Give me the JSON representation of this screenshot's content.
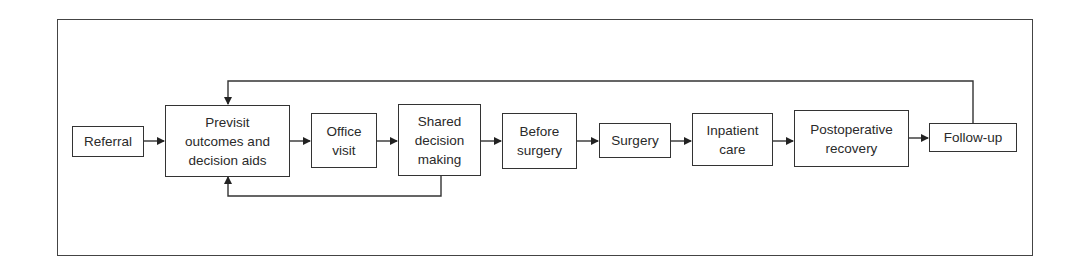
{
  "diagram": {
    "type": "flowchart",
    "direction": "left-to-right",
    "nodes": [
      {
        "id": "referral",
        "label": "Referral"
      },
      {
        "id": "previsit",
        "label": "Previsit\noutcomes and\ndecision aids"
      },
      {
        "id": "office",
        "label": "Office\nvisit"
      },
      {
        "id": "shared",
        "label": "Shared\ndecision\nmaking"
      },
      {
        "id": "before",
        "label": "Before\nsurgery"
      },
      {
        "id": "surgery",
        "label": "Surgery"
      },
      {
        "id": "inpatient",
        "label": "Inpatient\ncare"
      },
      {
        "id": "postop",
        "label": "Postoperative\nrecovery"
      },
      {
        "id": "followup",
        "label": "Follow-up"
      }
    ],
    "edges": [
      {
        "from": "referral",
        "to": "previsit"
      },
      {
        "from": "previsit",
        "to": "office"
      },
      {
        "from": "office",
        "to": "shared"
      },
      {
        "from": "shared",
        "to": "before"
      },
      {
        "from": "before",
        "to": "surgery"
      },
      {
        "from": "surgery",
        "to": "inpatient"
      },
      {
        "from": "inpatient",
        "to": "postop"
      },
      {
        "from": "postop",
        "to": "followup"
      },
      {
        "from": "followup",
        "to": "previsit",
        "route": "loop-over-top"
      },
      {
        "from": "shared",
        "to": "previsit",
        "route": "loop-under-bottom"
      }
    ],
    "colors": {
      "line": "#333333",
      "background": "#ffffff",
      "text": "#2a2a2a"
    }
  }
}
